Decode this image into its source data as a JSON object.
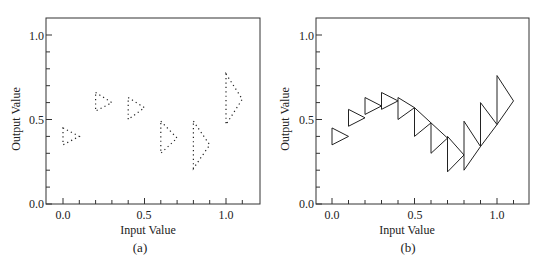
{
  "chart_data": [
    {
      "panel": "(a)",
      "type": "scatter",
      "marker": "dotted right-pointing triangle",
      "xlabel": "Input Value",
      "ylabel": "Output Value",
      "xlim": [
        -0.1,
        1.2
      ],
      "ylim": [
        0.0,
        1.1
      ],
      "xticks": [
        0.0,
        0.5,
        1.0
      ],
      "yticks": [
        0.0,
        0.5,
        1.0
      ],
      "x_minor_step": 0.1,
      "y_minor_step": 0.1,
      "grid": false,
      "points": [
        {
          "x": 0.0,
          "y_low": 0.35,
          "y_high": 0.45,
          "apex_y": 0.4
        },
        {
          "x": 0.2,
          "y_low": 0.55,
          "y_high": 0.66,
          "apex_y": 0.6
        },
        {
          "x": 0.4,
          "y_low": 0.5,
          "y_high": 0.63,
          "apex_y": 0.57
        },
        {
          "x": 0.6,
          "y_low": 0.3,
          "y_high": 0.49,
          "apex_y": 0.39
        },
        {
          "x": 0.8,
          "y_low": 0.21,
          "y_high": 0.49,
          "apex_y": 0.35
        },
        {
          "x": 1.0,
          "y_low": 0.47,
          "y_high": 0.77,
          "apex_y": 0.62
        }
      ],
      "triangle_width": 0.1
    },
    {
      "panel": "(b)",
      "type": "scatter",
      "marker": "solid right-pointing triangle",
      "xlabel": "Input Value",
      "ylabel": "Output Value",
      "xlim": [
        -0.1,
        1.2
      ],
      "ylim": [
        0.0,
        1.1
      ],
      "xticks": [
        0.0,
        0.5,
        1.0
      ],
      "yticks": [
        0.0,
        0.5,
        1.0
      ],
      "x_minor_step": 0.1,
      "y_minor_step": 0.1,
      "grid": false,
      "points": [
        {
          "x": 0.0,
          "y_low": 0.35,
          "y_high": 0.45,
          "apex_y": 0.4
        },
        {
          "x": 0.1,
          "y_low": 0.46,
          "y_high": 0.56,
          "apex_y": 0.51
        },
        {
          "x": 0.2,
          "y_low": 0.53,
          "y_high": 0.63,
          "apex_y": 0.58
        },
        {
          "x": 0.3,
          "y_low": 0.56,
          "y_high": 0.66,
          "apex_y": 0.61
        },
        {
          "x": 0.4,
          "y_low": 0.5,
          "y_high": 0.63,
          "apex_y": 0.57
        },
        {
          "x": 0.5,
          "y_low": 0.4,
          "y_high": 0.57,
          "apex_y": 0.48
        },
        {
          "x": 0.6,
          "y_low": 0.3,
          "y_high": 0.48,
          "apex_y": 0.39
        },
        {
          "x": 0.7,
          "y_low": 0.19,
          "y_high": 0.4,
          "apex_y": 0.29
        },
        {
          "x": 0.8,
          "y_low": 0.2,
          "y_high": 0.49,
          "apex_y": 0.34
        },
        {
          "x": 0.9,
          "y_low": 0.34,
          "y_high": 0.6,
          "apex_y": 0.47
        },
        {
          "x": 1.0,
          "y_low": 0.47,
          "y_high": 0.76,
          "apex_y": 0.61
        }
      ],
      "triangle_width": 0.1
    }
  ],
  "panels": [
    {
      "caption": "(a)",
      "xlabel": "Input Value",
      "ylabel": "Output Value",
      "xtick_labels": [
        "0.0",
        "0.5",
        "1.0"
      ],
      "ytick_labels": [
        "0.0",
        "0.5",
        "1.0"
      ]
    },
    {
      "caption": "(b)",
      "xlabel": "Input Value",
      "ylabel": "Output Value",
      "xtick_labels": [
        "0.0",
        "0.5",
        "1.0"
      ],
      "ytick_labels": [
        "0.0",
        "0.5",
        "1.0"
      ]
    }
  ],
  "colors": {
    "axis": "#333333",
    "marker": "#222222",
    "text": "#222222"
  }
}
